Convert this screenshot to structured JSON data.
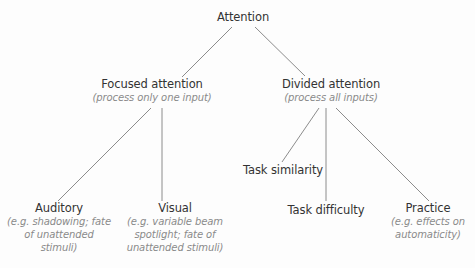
{
  "diagram": {
    "type": "tree",
    "line_color": "#8c8c8c",
    "root": {
      "label": "Attention"
    },
    "focused": {
      "label": "Focused attention",
      "sub": "(process only one input)",
      "children": {
        "auditory": {
          "label": "Auditory",
          "sub_lines": [
            "(e.g. shadowing; fate",
            "of unattended",
            "stimuli)"
          ]
        },
        "visual": {
          "label": "Visual",
          "sub_lines": [
            "(e.g. variable beam",
            "spotlight; fate of",
            "unattended stimuli)"
          ]
        }
      }
    },
    "divided": {
      "label": "Divided attention",
      "sub": "(process all inputs)",
      "children": {
        "similarity": {
          "label": "Task similarity"
        },
        "difficulty": {
          "label": "Task difficulty"
        },
        "practice": {
          "label": "Practice",
          "sub_lines": [
            "(e.g. effects on",
            "automaticity)"
          ]
        }
      }
    }
  }
}
